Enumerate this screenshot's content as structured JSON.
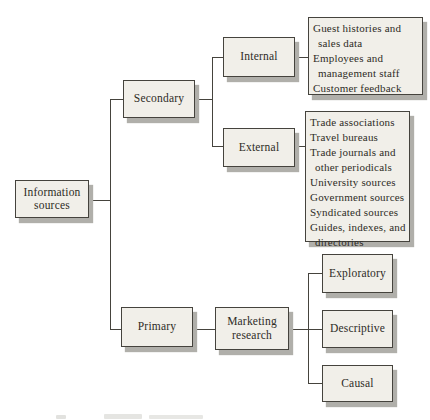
{
  "diagram": {
    "nodes": {
      "root": {
        "label": "Information sources"
      },
      "secondary": {
        "label": "Secondary"
      },
      "primary": {
        "label": "Primary"
      },
      "internal": {
        "label": "Internal"
      },
      "external": {
        "label": "External"
      },
      "marketing": {
        "label": "Marketing research"
      },
      "exploratory": {
        "label": "Exploratory"
      },
      "descriptive": {
        "label": "Descriptive"
      },
      "causal": {
        "label": "Causal"
      }
    },
    "lists": {
      "internal": {
        "items": [
          "Guest histories and sales data",
          "Employees and management staff",
          "Customer feedback"
        ]
      },
      "external": {
        "items": [
          "Trade associations",
          "Travel bureaus",
          "Trade journals and other periodicals",
          "University sources",
          "Government sources",
          "Syndicated sources",
          "Guides, indexes, and directories"
        ]
      }
    },
    "colors": {
      "background": "#ffffff",
      "box_fill": "#f1efe9",
      "box_border": "#45433d",
      "box_shadow": "#b0afaa",
      "line": "#45433d",
      "text": "#2e2c26"
    }
  }
}
